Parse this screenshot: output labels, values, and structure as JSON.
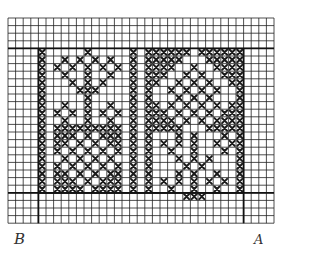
{
  "diagram": {
    "type": "cross-stitch-chart",
    "grid": {
      "origin_x": 8,
      "origin_y": 18,
      "cell": 7.6,
      "cols": 35,
      "rows": 27,
      "line_color": "#222222",
      "background": "#ffffff",
      "stitch_color": "#1a1a1a"
    },
    "heavy_lines": {
      "horizontal_rows": [
        4,
        23
      ],
      "vertical_cols": [
        4,
        31
      ],
      "extra": [
        {
          "type": "h",
          "row": 23,
          "from_col": 4,
          "to_col": 31
        },
        {
          "type": "v",
          "col": 4,
          "from_row": 4,
          "to_row": 27
        },
        {
          "type": "v",
          "col": 31,
          "from_row": 4,
          "to_row": 27
        }
      ]
    },
    "labels": {
      "left": "B",
      "right": "A"
    },
    "stitches": [
      [
        4,
        4
      ],
      [
        4,
        5
      ],
      [
        4,
        6
      ],
      [
        4,
        7
      ],
      [
        4,
        8
      ],
      [
        4,
        9
      ],
      [
        4,
        10
      ],
      [
        4,
        11
      ],
      [
        4,
        12
      ],
      [
        4,
        13
      ],
      [
        4,
        14
      ],
      [
        4,
        15
      ],
      [
        4,
        16
      ],
      [
        4,
        17
      ],
      [
        4,
        18
      ],
      [
        4,
        19
      ],
      [
        4,
        20
      ],
      [
        4,
        21
      ],
      [
        4,
        22
      ],
      [
        16,
        4
      ],
      [
        16,
        5
      ],
      [
        16,
        6
      ],
      [
        16,
        7
      ],
      [
        16,
        8
      ],
      [
        16,
        9
      ],
      [
        16,
        10
      ],
      [
        16,
        11
      ],
      [
        16,
        12
      ],
      [
        16,
        13
      ],
      [
        16,
        14
      ],
      [
        16,
        15
      ],
      [
        16,
        16
      ],
      [
        16,
        17
      ],
      [
        16,
        18
      ],
      [
        16,
        19
      ],
      [
        16,
        20
      ],
      [
        16,
        21
      ],
      [
        16,
        22
      ],
      [
        18,
        4
      ],
      [
        18,
        5
      ],
      [
        18,
        6
      ],
      [
        18,
        7
      ],
      [
        18,
        8
      ],
      [
        18,
        9
      ],
      [
        18,
        10
      ],
      [
        18,
        11
      ],
      [
        18,
        12
      ],
      [
        18,
        13
      ],
      [
        18,
        14
      ],
      [
        18,
        15
      ],
      [
        18,
        16
      ],
      [
        18,
        17
      ],
      [
        18,
        18
      ],
      [
        18,
        19
      ],
      [
        18,
        20
      ],
      [
        18,
        21
      ],
      [
        18,
        22
      ],
      [
        30,
        4
      ],
      [
        30,
        5
      ],
      [
        30,
        6
      ],
      [
        30,
        7
      ],
      [
        30,
        8
      ],
      [
        30,
        9
      ],
      [
        30,
        10
      ],
      [
        30,
        11
      ],
      [
        30,
        12
      ],
      [
        30,
        13
      ],
      [
        30,
        14
      ],
      [
        30,
        15
      ],
      [
        30,
        16
      ],
      [
        30,
        17
      ],
      [
        30,
        18
      ],
      [
        30,
        19
      ],
      [
        30,
        20
      ],
      [
        30,
        21
      ],
      [
        30,
        22
      ],
      [
        10,
        4
      ],
      [
        7,
        5
      ],
      [
        9,
        5
      ],
      [
        11,
        5
      ],
      [
        13,
        5
      ],
      [
        6,
        6
      ],
      [
        8,
        6
      ],
      [
        10,
        6
      ],
      [
        12,
        6
      ],
      [
        14,
        6
      ],
      [
        7,
        7
      ],
      [
        10,
        7
      ],
      [
        13,
        7
      ],
      [
        8,
        8
      ],
      [
        10,
        8
      ],
      [
        12,
        8
      ],
      [
        9,
        9
      ],
      [
        10,
        9
      ],
      [
        11,
        9
      ],
      [
        10,
        10
      ],
      [
        7,
        11
      ],
      [
        10,
        11
      ],
      [
        13,
        11
      ],
      [
        6,
        12
      ],
      [
        8,
        12
      ],
      [
        10,
        12
      ],
      [
        12,
        12
      ],
      [
        14,
        12
      ],
      [
        7,
        13
      ],
      [
        10,
        13
      ],
      [
        13,
        13
      ],
      [
        6,
        14
      ],
      [
        7,
        14
      ],
      [
        8,
        14
      ],
      [
        9,
        14
      ],
      [
        10,
        14
      ],
      [
        11,
        14
      ],
      [
        12,
        14
      ],
      [
        13,
        14
      ],
      [
        14,
        14
      ],
      [
        6,
        15
      ],
      [
        7,
        15
      ],
      [
        8,
        15
      ],
      [
        10,
        15
      ],
      [
        12,
        15
      ],
      [
        13,
        15
      ],
      [
        14,
        15
      ],
      [
        6,
        16
      ],
      [
        7,
        16
      ],
      [
        9,
        16
      ],
      [
        11,
        16
      ],
      [
        13,
        16
      ],
      [
        14,
        16
      ],
      [
        6,
        17
      ],
      [
        8,
        17
      ],
      [
        10,
        17
      ],
      [
        12,
        17
      ],
      [
        14,
        17
      ],
      [
        7,
        18
      ],
      [
        9,
        18
      ],
      [
        11,
        18
      ],
      [
        13,
        18
      ],
      [
        6,
        19
      ],
      [
        8,
        19
      ],
      [
        10,
        19
      ],
      [
        12,
        19
      ],
      [
        14,
        19
      ],
      [
        6,
        20
      ],
      [
        7,
        20
      ],
      [
        9,
        20
      ],
      [
        11,
        20
      ],
      [
        13,
        20
      ],
      [
        14,
        20
      ],
      [
        6,
        21
      ],
      [
        7,
        21
      ],
      [
        8,
        21
      ],
      [
        10,
        21
      ],
      [
        12,
        21
      ],
      [
        13,
        21
      ],
      [
        14,
        21
      ],
      [
        6,
        22
      ],
      [
        7,
        22
      ],
      [
        8,
        22
      ],
      [
        9,
        22
      ],
      [
        11,
        22
      ],
      [
        12,
        22
      ],
      [
        13,
        22
      ],
      [
        14,
        22
      ],
      [
        19,
        4
      ],
      [
        20,
        4
      ],
      [
        21,
        4
      ],
      [
        22,
        4
      ],
      [
        23,
        4
      ],
      [
        25,
        4
      ],
      [
        26,
        4
      ],
      [
        27,
        4
      ],
      [
        28,
        4
      ],
      [
        29,
        4
      ],
      [
        19,
        5
      ],
      [
        20,
        5
      ],
      [
        21,
        5
      ],
      [
        22,
        5
      ],
      [
        26,
        5
      ],
      [
        27,
        5
      ],
      [
        28,
        5
      ],
      [
        29,
        5
      ],
      [
        19,
        6
      ],
      [
        20,
        6
      ],
      [
        21,
        6
      ],
      [
        24,
        6
      ],
      [
        27,
        6
      ],
      [
        28,
        6
      ],
      [
        29,
        6
      ],
      [
        19,
        7
      ],
      [
        20,
        7
      ],
      [
        23,
        7
      ],
      [
        25,
        7
      ],
      [
        28,
        7
      ],
      [
        29,
        7
      ],
      [
        19,
        8
      ],
      [
        22,
        8
      ],
      [
        24,
        8
      ],
      [
        26,
        8
      ],
      [
        29,
        8
      ],
      [
        21,
        9
      ],
      [
        23,
        9
      ],
      [
        25,
        9
      ],
      [
        27,
        9
      ],
      [
        22,
        10
      ],
      [
        24,
        10
      ],
      [
        26,
        10
      ],
      [
        19,
        11
      ],
      [
        21,
        11
      ],
      [
        23,
        11
      ],
      [
        25,
        11
      ],
      [
        27,
        11
      ],
      [
        29,
        11
      ],
      [
        19,
        12
      ],
      [
        20,
        12
      ],
      [
        22,
        12
      ],
      [
        24,
        12
      ],
      [
        26,
        12
      ],
      [
        28,
        12
      ],
      [
        29,
        12
      ],
      [
        19,
        13
      ],
      [
        20,
        13
      ],
      [
        21,
        13
      ],
      [
        23,
        13
      ],
      [
        25,
        13
      ],
      [
        27,
        13
      ],
      [
        28,
        13
      ],
      [
        29,
        13
      ],
      [
        19,
        14
      ],
      [
        20,
        14
      ],
      [
        21,
        14
      ],
      [
        22,
        14
      ],
      [
        26,
        14
      ],
      [
        27,
        14
      ],
      [
        28,
        14
      ],
      [
        29,
        14
      ],
      [
        22,
        15
      ],
      [
        24,
        15
      ],
      [
        28,
        15
      ],
      [
        20,
        16
      ],
      [
        22,
        16
      ],
      [
        24,
        16
      ],
      [
        27,
        16
      ],
      [
        29,
        16
      ],
      [
        21,
        17
      ],
      [
        24,
        17
      ],
      [
        28,
        17
      ],
      [
        22,
        18
      ],
      [
        24,
        18
      ],
      [
        26,
        18
      ],
      [
        23,
        19
      ],
      [
        25,
        19
      ],
      [
        22,
        20
      ],
      [
        24,
        20
      ],
      [
        27,
        20
      ],
      [
        20,
        21
      ],
      [
        22,
        21
      ],
      [
        24,
        21
      ],
      [
        26,
        21
      ],
      [
        28,
        21
      ],
      [
        21,
        22
      ],
      [
        24,
        22
      ],
      [
        27,
        22
      ],
      [
        23,
        23
      ],
      [
        24,
        23
      ],
      [
        25,
        23
      ]
    ]
  }
}
